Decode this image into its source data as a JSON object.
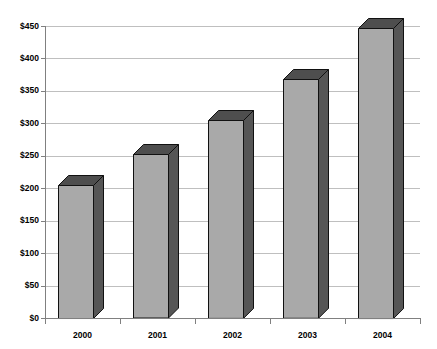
{
  "chart_data": {
    "type": "bar",
    "title": "",
    "subtitle": "",
    "xlabel": "",
    "ylabel": "",
    "categories": [
      "2000",
      "2001",
      "2002",
      "2003",
      "2004"
    ],
    "values": [
      205,
      252,
      305,
      368,
      447
    ],
    "series": [
      {
        "name": "",
        "values": [
          205,
          252,
          305,
          368,
          447
        ]
      }
    ],
    "ylim": [
      0,
      450
    ],
    "ytick_values": [
      0,
      50,
      100,
      150,
      200,
      250,
      300,
      350,
      400,
      450
    ],
    "ytick_labels": [
      "$0",
      "$50",
      "$100",
      "$150",
      "$200",
      "$250",
      "$300",
      "$350",
      "$400",
      "$450"
    ],
    "grid": true,
    "legend": false,
    "legend_position": "none",
    "style": "3d-column",
    "colors": {
      "bar_front": "#a9a9a9",
      "bar_side": "#565656",
      "bar_top": "#4e4e4e",
      "bar_outline": "#111111",
      "gridline": "#bfbfbf",
      "axis": "#808080",
      "background": "#ffffff",
      "text": "#000000"
    }
  }
}
